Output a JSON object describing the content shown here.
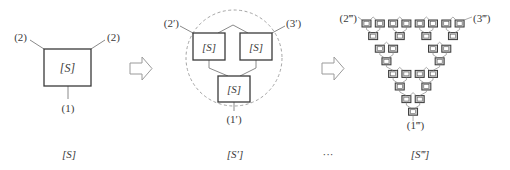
{
  "figure": {
    "stages": [
      {
        "id": "S",
        "caption": "[S]",
        "box_label": "[S]",
        "ports": {
          "left": "(2)",
          "right": "(2)",
          "bottom": "(1)"
        }
      },
      {
        "id": "S_prime",
        "caption": "[S′]",
        "box_label": "[S]",
        "ports": {
          "left": "(2′)",
          "right": "(3′)",
          "bottom": "(1′)"
        },
        "unit_boxes": 3
      },
      {
        "id": "S_triple_prime",
        "caption": "[S‴]",
        "box_label": "[S]",
        "ports": {
          "left": "(2‴)",
          "right": "(3‴)",
          "bottom": "(1‴)"
        },
        "unit_boxes": 27
      }
    ],
    "ellipsis": "···",
    "arrows": [
      "hollow-right-arrow",
      "hollow-right-arrow"
    ],
    "colors": {
      "box_stroke": "#3a3a3a",
      "connector": "#8a8a8a",
      "dashed_circle": "#9a9a9a",
      "arrow": "#9a9a9a",
      "small_box_fill": "#c8c8c8"
    }
  }
}
